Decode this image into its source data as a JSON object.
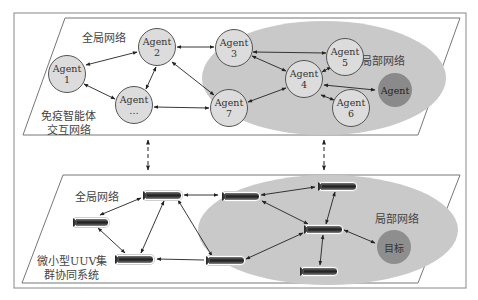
{
  "top_panel": {
    "global_label": "全局网络",
    "local_label": "局部网络",
    "system_label_line1": "免疫智能体",
    "system_label_line2": "交互网络",
    "agents": [
      {
        "id": "a1",
        "line1": "Agent",
        "line2": "1"
      },
      {
        "id": "a2",
        "line1": "Agent",
        "line2": "2"
      },
      {
        "id": "a_dots",
        "line1": "Agent",
        "line2": "…"
      },
      {
        "id": "a3",
        "line1": "Agent",
        "line2": "3"
      },
      {
        "id": "a7",
        "line1": "Agent",
        "line2": "7"
      },
      {
        "id": "a4",
        "line1": "Agent",
        "line2": "4"
      },
      {
        "id": "a5",
        "line1": "Agent",
        "line2": "5"
      },
      {
        "id": "a6",
        "line1": "Agent",
        "line2": "6"
      },
      {
        "id": "a_target",
        "line1": "Agent",
        "line2": ""
      }
    ]
  },
  "bottom_panel": {
    "global_label": "全局网络",
    "local_label": "局部网络",
    "system_label_line1": "微小型UUV集",
    "system_label_line2": "群协同系统",
    "target_label": "目标",
    "uuv_count": 8
  },
  "colors": {
    "ellipse": "#c8c8c8",
    "node_fill": "#dcdcdc",
    "dark_node": "#8a8a8a",
    "line": "#333333"
  }
}
